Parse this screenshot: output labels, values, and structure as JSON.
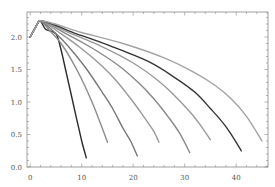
{
  "chart_data": {
    "type": "line",
    "title": "",
    "xlabel": "",
    "ylabel": "",
    "xlim": [
      -0.5,
      46.3
    ],
    "ylim": [
      0.0,
      2.37
    ],
    "grid": false,
    "legend": null,
    "x_ticks": [
      0,
      10,
      20,
      30,
      40
    ],
    "x_tick_labels": [
      "0",
      "10",
      "20",
      "30",
      "40"
    ],
    "y_ticks": [
      0.0,
      0.5,
      1.0,
      1.5,
      2.0
    ],
    "y_tick_labels": [
      "0.0",
      "0.5",
      "1.0",
      "1.5",
      "2.0"
    ],
    "series": [
      {
        "name": "curve-1",
        "color": "#2a2a2a",
        "x": [
          0,
          1.7,
          3,
          5,
          6,
          7,
          8,
          9,
          10,
          10.9
        ],
        "y": [
          2.0,
          2.25,
          2.12,
          2.05,
          1.8,
          1.45,
          1.1,
          0.75,
          0.4,
          0.14
        ]
      },
      {
        "name": "curve-2",
        "color": "#8c8c8c",
        "x": [
          0,
          1.7,
          4,
          6,
          8,
          10,
          12,
          13.5,
          15
        ],
        "y": [
          2.0,
          2.25,
          2.08,
          1.9,
          1.65,
          1.35,
          1.0,
          0.7,
          0.38
        ]
      },
      {
        "name": "curve-3",
        "color": "#777777",
        "x": [
          0,
          1.7,
          5,
          8,
          11,
          14,
          16,
          18,
          19.5,
          20.8
        ],
        "y": [
          2.0,
          2.25,
          2.05,
          1.8,
          1.5,
          1.15,
          0.9,
          0.6,
          0.4,
          0.17
        ]
      },
      {
        "name": "curve-4",
        "color": "#999999",
        "x": [
          0,
          1.7,
          6,
          10,
          14,
          17,
          20,
          22,
          24,
          25
        ],
        "y": [
          2.0,
          2.25,
          2.05,
          1.82,
          1.55,
          1.3,
          1.0,
          0.78,
          0.55,
          0.38
        ]
      },
      {
        "name": "curve-5",
        "color": "#888888",
        "x": [
          0,
          1.7,
          7,
          12,
          17,
          21,
          24,
          27,
          29,
          31
        ],
        "y": [
          2.0,
          2.25,
          2.05,
          1.83,
          1.57,
          1.3,
          1.05,
          0.75,
          0.52,
          0.22
        ]
      },
      {
        "name": "curve-6",
        "color": "#9a9a9a",
        "x": [
          0,
          1.7,
          8,
          14,
          20,
          25,
          28,
          31,
          33,
          35
        ],
        "y": [
          2.0,
          2.25,
          2.05,
          1.85,
          1.6,
          1.32,
          1.1,
          0.85,
          0.65,
          0.42
        ]
      },
      {
        "name": "curve-7",
        "color": "#333333",
        "x": [
          0,
          1.7,
          9,
          16,
          23,
          28,
          32,
          35,
          38,
          41
        ],
        "y": [
          2.0,
          2.25,
          2.05,
          1.85,
          1.62,
          1.38,
          1.15,
          0.9,
          0.62,
          0.25
        ]
      },
      {
        "name": "curve-8",
        "color": "#a3a3a3",
        "x": [
          0,
          1.7,
          10,
          18,
          26,
          32,
          36,
          39,
          42,
          45
        ],
        "y": [
          2.0,
          2.25,
          2.07,
          1.9,
          1.68,
          1.45,
          1.25,
          1.05,
          0.78,
          0.4
        ]
      }
    ]
  }
}
